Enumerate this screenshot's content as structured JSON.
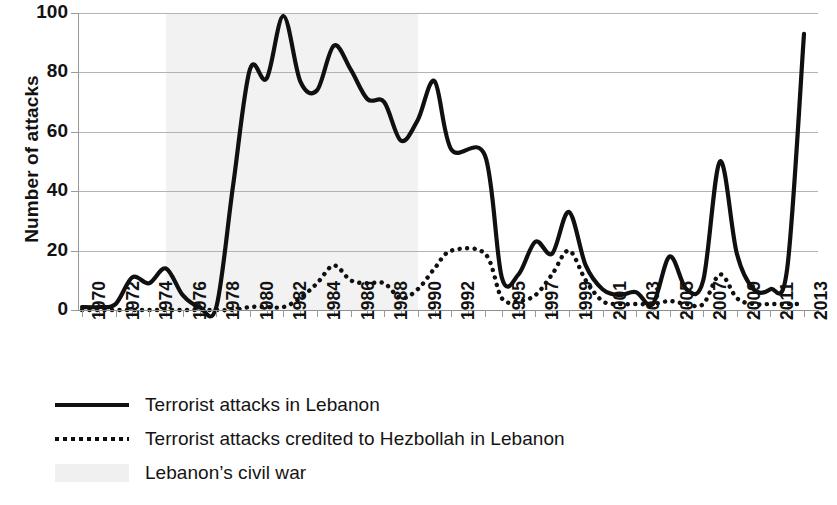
{
  "chart_data": {
    "type": "line",
    "title": "",
    "xlabel": "",
    "ylabel": "Number of attacks",
    "ylim": [
      0,
      100
    ],
    "yticks": [
      0,
      20,
      40,
      60,
      80,
      100
    ],
    "grid": true,
    "legend_position": "bottom-left",
    "x": [
      1970,
      1971,
      1972,
      1973,
      1974,
      1975,
      1976,
      1977,
      1978,
      1979,
      1980,
      1981,
      1982,
      1983,
      1984,
      1985,
      1986,
      1987,
      1988,
      1989,
      1990,
      1991,
      1992,
      1994,
      1995,
      1996,
      1997,
      1998,
      1999,
      2000,
      2001,
      2002,
      2003,
      2004,
      2005,
      2006,
      2007,
      2008,
      2009,
      2010,
      2011,
      2012,
      2013
    ],
    "xticklabels": [
      "1970",
      "1972",
      "1974",
      "1976",
      "1978",
      "1980",
      "1982",
      "1984",
      "1986",
      "1988",
      "1990",
      "1992",
      "1995",
      "1997",
      "1999",
      "2001",
      "2003",
      "2005",
      "2007",
      "2009",
      "2011",
      "2013"
    ],
    "series": [
      {
        "name": "Terrorist attacks in Lebanon",
        "style": "solid",
        "color": "#101010",
        "values": [
          1,
          1,
          2,
          11,
          9,
          14,
          5,
          1,
          1,
          42,
          81,
          78,
          99,
          77,
          74,
          89,
          81,
          71,
          70,
          57,
          64,
          77,
          54,
          52,
          11,
          12,
          23,
          19,
          33,
          15,
          7,
          5,
          6,
          2,
          18,
          7,
          10,
          50,
          19,
          7,
          7,
          14,
          93
        ]
      },
      {
        "name": "Terrorist attacks credited to Hezbollah in Lebanon",
        "style": "dotted",
        "color": "#101010",
        "values": [
          0,
          0,
          0,
          0,
          0,
          0,
          0,
          0,
          0,
          0,
          1,
          1,
          1,
          4,
          9,
          15,
          10,
          9,
          9,
          4,
          7,
          14,
          20,
          19,
          4,
          3,
          5,
          12,
          20,
          10,
          3,
          2,
          2,
          2,
          3,
          2,
          2,
          12,
          4,
          2,
          2,
          2,
          2
        ]
      }
    ],
    "shaded_regions": [
      {
        "label": "Lebanon’s civil war",
        "start": 1975,
        "end": 1990,
        "color": "#f2f2f2"
      }
    ]
  },
  "axes": {
    "y_title": "Number of attacks",
    "y_ticks": [
      "0",
      "20",
      "40",
      "60",
      "80",
      "100"
    ],
    "x_ticks": [
      "1970",
      "1972",
      "1974",
      "1976",
      "1978",
      "1980",
      "1982",
      "1984",
      "1986",
      "1988",
      "1990",
      "1992",
      "1995",
      "1997",
      "1999",
      "2001",
      "2003",
      "2005",
      "2007",
      "2009",
      "2011",
      "2013"
    ]
  },
  "legend": {
    "items": [
      {
        "label": "Terrorist attacks in Lebanon",
        "swatch": "solid-line"
      },
      {
        "label": "Terrorist attacks credited to Hezbollah in Lebanon",
        "swatch": "dotted-line"
      },
      {
        "label": "Lebanon’s civil war",
        "swatch": "shaded-band"
      }
    ]
  }
}
